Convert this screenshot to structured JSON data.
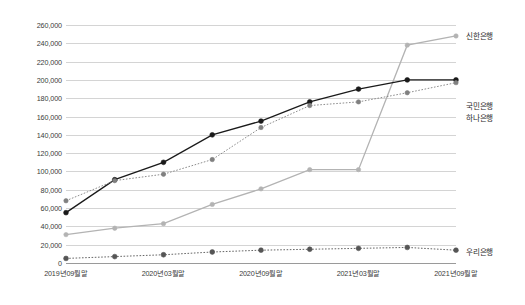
{
  "chart_data": {
    "type": "line",
    "title": "",
    "subtitle": "",
    "xlabel": "",
    "ylabel": "",
    "ylim": [
      0,
      260000
    ],
    "ytick_step": 20000,
    "grid": true,
    "legend_position": "right-inline",
    "ytick_labels": [
      "260,000",
      "240,000",
      "220,000",
      "200,000",
      "180,000",
      "160,000",
      "140,000",
      "120,000",
      "100,000",
      "80,000",
      "60,000",
      "40,000",
      "20,000",
      "0"
    ],
    "ytick_values": [
      260000,
      240000,
      220000,
      200000,
      180000,
      160000,
      140000,
      120000,
      100000,
      80000,
      60000,
      40000,
      20000,
      0
    ],
    "xtick_labels": [
      "2019년09월말",
      "2020년03월말",
      "2020년09월말",
      "2021년03월말",
      "2021년09월말"
    ],
    "xtick_indices": [
      0,
      2,
      4,
      6,
      8
    ],
    "x": [
      0,
      1,
      2,
      3,
      4,
      5,
      6,
      7,
      8
    ],
    "series": [
      {
        "name": "신한은행",
        "color": "#b3b3b3",
        "style": "solid",
        "marker": "circle",
        "values": [
          31000,
          38000,
          43000,
          64000,
          81000,
          102000,
          102000,
          238000,
          248000
        ],
        "label_y": 30
      },
      {
        "name": "국민은행",
        "color": "#1a1a1a",
        "style": "solid",
        "marker": "circle-filled",
        "values": [
          55000,
          91000,
          110000,
          140000,
          155000,
          176000,
          190000,
          200000,
          200000
        ],
        "label_y": 100
      },
      {
        "name": "하나은행",
        "color": "#808080",
        "style": "dotted",
        "marker": "circle",
        "values": [
          68000,
          90000,
          97000,
          113000,
          148000,
          172000,
          176000,
          186000,
          197000
        ],
        "label_y": 112
      },
      {
        "name": "우리은행",
        "color": "#555555",
        "style": "dotted",
        "marker": "circle-filled",
        "values": [
          5000,
          7000,
          9000,
          12000,
          14000,
          15000,
          16000,
          17000,
          14000
        ],
        "label_y": 246
      }
    ]
  }
}
